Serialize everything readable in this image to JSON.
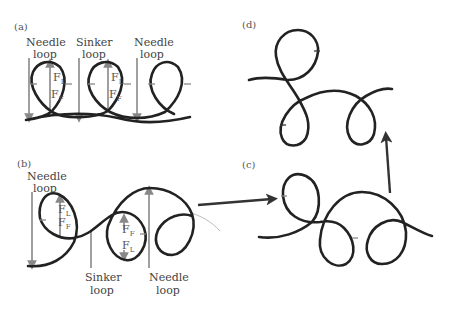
{
  "figure": {
    "panels": [
      {
        "id": "a",
        "label": "(a)",
        "annotations": [
          "Needle loop",
          "Sinker loop",
          "Needle loop"
        ],
        "forces": [
          "F_L",
          "F_F",
          "F_L",
          "F_F"
        ]
      },
      {
        "id": "b",
        "label": "(b)",
        "annotations": [
          "Needle loop",
          "Sinker loop",
          "Needle loop"
        ],
        "forces": [
          "F_L",
          "F_F",
          "F_F",
          "F_L"
        ]
      },
      {
        "id": "c",
        "label": "(c)"
      },
      {
        "id": "d",
        "label": "(d)"
      }
    ],
    "labels": {
      "a": {
        "panel": "(a)",
        "needle1_l1": "Needle",
        "needle1_l2": "loop",
        "sinker_l1": "Sinker",
        "sinker_l2": "loop",
        "needle2_l1": "Needle",
        "needle2_l2": "loop"
      },
      "b": {
        "panel": "(b)",
        "needle1_l1": "Needle",
        "needle1_l2": "loop",
        "sinker_l1": "Sinker",
        "sinker_l2": "loop",
        "needle2_l1": "Needle",
        "needle2_l2": "loop"
      },
      "c": {
        "panel": "(c)"
      },
      "d": {
        "panel": "(d)"
      }
    },
    "force": {
      "F": "F",
      "L": "L",
      "Fsub": "F"
    },
    "colors": {
      "yarn": "#222222",
      "force_arrow": "#888888",
      "flow_arrow": "#333333"
    }
  }
}
